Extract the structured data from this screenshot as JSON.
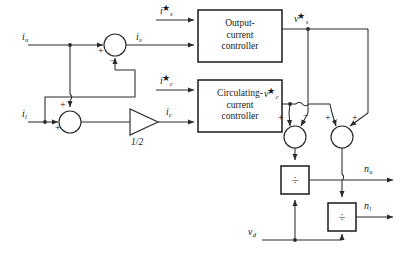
{
  "diagram": {
    "colors": {
      "line": "#2b2b2b",
      "block_border": "#1a1a1a",
      "block_fill": "#ffffff",
      "text": "#151515",
      "background": "#ffffff"
    },
    "blocks": [
      {
        "id": "output-current-controller",
        "name": "output-current-controller-block",
        "lines": [
          "Output-",
          "current",
          "controller"
        ],
        "x": 198,
        "y": 10,
        "w": 84,
        "h": 52
      },
      {
        "id": "circulating-current-controller",
        "name": "circulating-current-controller-block",
        "lines": [
          "Circulating-",
          "current",
          "controller"
        ],
        "x": 198,
        "y": 80,
        "w": 84,
        "h": 52
      },
      {
        "id": "divider-upper",
        "name": "divider-upper-block",
        "lines": [
          "÷"
        ],
        "x": 281,
        "y": 166,
        "w": 28,
        "h": 28
      },
      {
        "id": "divider-lower",
        "name": "divider-lower-block",
        "lines": [
          "÷"
        ],
        "x": 328,
        "y": 203,
        "w": 28,
        "h": 28
      }
    ],
    "gain": {
      "name": "half-gain-triangle",
      "label": "1/2",
      "x": 130,
      "y": 110,
      "w": 28,
      "h": 26
    },
    "summing_junctions": [
      {
        "id": "sum-output-current",
        "name": "summing-junction-output-current",
        "cx": 115,
        "cy": 45,
        "r": 11,
        "signs": [
          {
            "text": "+",
            "x": 99,
            "y": 50
          },
          {
            "text": "−",
            "x": 110,
            "y": 62
          }
        ]
      },
      {
        "id": "sum-circulating-current",
        "name": "summing-junction-circulating-current",
        "cx": 70,
        "cy": 122,
        "r": 11,
        "signs": [
          {
            "text": "+",
            "x": 56,
            "y": 128
          },
          {
            "text": "+",
            "x": 66,
            "y": 106
          }
        ]
      },
      {
        "id": "sum-upper-arm-voltage",
        "name": "summing-junction-upper-arm-voltage",
        "cx": 295,
        "cy": 137,
        "r": 11,
        "signs": [
          {
            "text": "+",
            "x": 277,
            "y": 118
          },
          {
            "text": "−",
            "x": 305,
            "y": 118
          }
        ]
      },
      {
        "id": "sum-lower-arm-voltage",
        "name": "summing-junction-lower-arm-voltage",
        "cx": 342,
        "cy": 137,
        "r": 11,
        "signs": [
          {
            "text": "+",
            "x": 324,
            "y": 118
          },
          {
            "text": "+",
            "x": 353,
            "y": 118
          }
        ]
      }
    ],
    "signals": [
      {
        "id": "i_u",
        "name": "signal-label-iu",
        "base": "i",
        "sub": "u",
        "star": false,
        "x": 22,
        "y": 31
      },
      {
        "id": "i_l",
        "name": "signal-label-il",
        "base": "i",
        "sub": "l",
        "star": false,
        "x": 22,
        "y": 108
      },
      {
        "id": "i_s",
        "name": "signal-label-is",
        "base": "i",
        "sub": "s",
        "star": false,
        "x": 136,
        "y": 31
      },
      {
        "id": "i_c",
        "name": "signal-label-ic",
        "base": "i",
        "sub": "c",
        "star": false,
        "x": 166,
        "y": 106
      },
      {
        "id": "i_s_ref",
        "name": "signal-label-is-ref",
        "base": "i",
        "sub": "s",
        "star": true,
        "x": 163,
        "y": 4
      },
      {
        "id": "i_c_ref",
        "name": "signal-label-ic-ref",
        "base": "i",
        "sub": "c",
        "star": true,
        "x": 163,
        "y": 74
      },
      {
        "id": "v_s_ref",
        "name": "signal-label-vs-ref",
        "base": "v",
        "sub": "s",
        "star": true,
        "x": 296,
        "y": 12
      },
      {
        "id": "v_c_ref",
        "name": "signal-label-vc-ref",
        "base": "v",
        "sub": "c",
        "star": true,
        "x": 266,
        "y": 93
      },
      {
        "id": "n_u",
        "name": "signal-label-nu",
        "base": "n",
        "sub": "u",
        "star": false,
        "x": 364,
        "y": 163
      },
      {
        "id": "n_l",
        "name": "signal-label-nl",
        "base": "n",
        "sub": "l",
        "star": false,
        "x": 364,
        "y": 200
      },
      {
        "id": "v_d",
        "name": "signal-label-vd",
        "base": "v",
        "sub": "d",
        "star": false,
        "x": 250,
        "y": 226
      }
    ]
  }
}
